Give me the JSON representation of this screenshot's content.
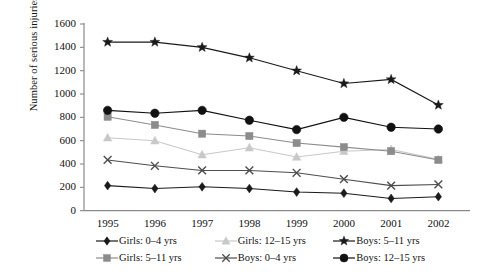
{
  "chart_data": {
    "type": "line",
    "title": "",
    "xlabel": "",
    "ylabel": "Number of serious injuries or deaths",
    "categories": [
      "1995",
      "1996",
      "1997",
      "1998",
      "1999",
      "2000",
      "2001",
      "2002"
    ],
    "ylim": [
      0,
      1600
    ],
    "ytick_values": [
      0,
      200,
      400,
      600,
      800,
      1000,
      1200,
      1400,
      1600
    ],
    "ytick_labels": [
      "0",
      "200",
      "400",
      "600",
      "800",
      "1000",
      "1200",
      "1400",
      "1600"
    ],
    "grid": false,
    "legend_position": "bottom",
    "series": [
      {
        "name": "Girls: 0–4 yrs",
        "marker": "diamond",
        "color": "#1a1a1a",
        "values": [
          215,
          190,
          205,
          190,
          160,
          150,
          105,
          120
        ]
      },
      {
        "name": "Girls: 5–11 yrs",
        "marker": "square",
        "color": "#8c8c8c",
        "values": [
          805,
          735,
          660,
          640,
          580,
          545,
          510,
          435
        ]
      },
      {
        "name": "Girls: 12–15 yrs",
        "marker": "triangle",
        "color": "#c8c8c8",
        "values": [
          625,
          600,
          480,
          540,
          460,
          510,
          525,
          440
        ]
      },
      {
        "name": "Boys: 0–4 yrs",
        "marker": "cross",
        "color": "#4d4d4d",
        "values": [
          435,
          385,
          345,
          345,
          325,
          270,
          215,
          225
        ]
      },
      {
        "name": "Boys: 5–11 yrs",
        "marker": "star",
        "color": "#1a1a1a",
        "values": [
          1445,
          1445,
          1400,
          1310,
          1200,
          1090,
          1125,
          905
        ]
      },
      {
        "name": "Boys: 12–15 yrs",
        "marker": "circle",
        "color": "#111111",
        "values": [
          860,
          835,
          860,
          775,
          695,
          800,
          715,
          700
        ]
      }
    ]
  },
  "legend": {
    "items": [
      {
        "label": "Girls: 0–4 yrs",
        "series": 0
      },
      {
        "label": "Girls: 12–15 yrs",
        "series": 2
      },
      {
        "label": "Boys: 5–11 yrs",
        "series": 4
      },
      {
        "label": "Girls: 5–11 yrs",
        "series": 1
      },
      {
        "label": "Boys: 0–4 yrs",
        "series": 3
      },
      {
        "label": "Boys: 12–15 yrs",
        "series": 5
      }
    ]
  }
}
